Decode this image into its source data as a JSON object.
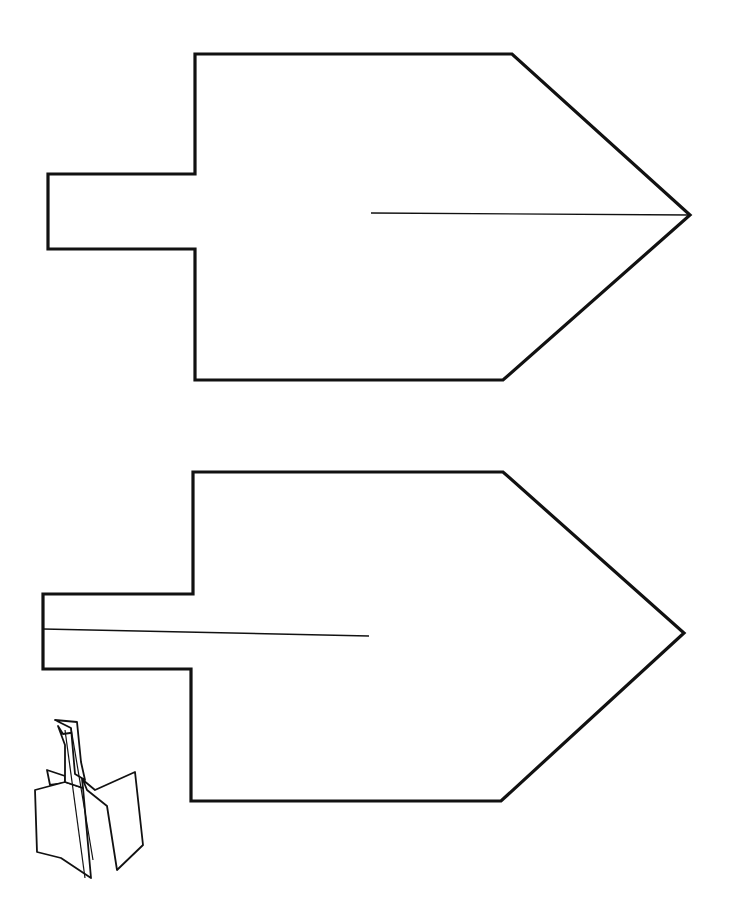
{
  "canvas": {
    "width": 731,
    "height": 901,
    "background": "#ffffff",
    "ink": "#111111"
  },
  "diagram": {
    "type": "paper-craft template",
    "pieces": [
      {
        "name": "top-piece",
        "outline_points": "195,54 512,54 690,215 503,380 195,380 195,249 48,249 48,174 195,174",
        "fold_line": {
          "x1": 371,
          "y1": 213,
          "x2": 690,
          "y2": 215
        },
        "fold_line_side": "point (right)"
      },
      {
        "name": "bottom-piece",
        "outline_points": "193,472 503,472 684,633 501,801 191,801 191,669 43,669 43,594 193,594",
        "fold_line": {
          "x1": 43,
          "y1": 629,
          "x2": 369,
          "y2": 636
        },
        "fold_line_side": "handle (left)"
      }
    ],
    "assembled_sketch": {
      "name": "assembled-dreidel-illustration",
      "position": {
        "x": 25,
        "y": 710
      }
    }
  }
}
